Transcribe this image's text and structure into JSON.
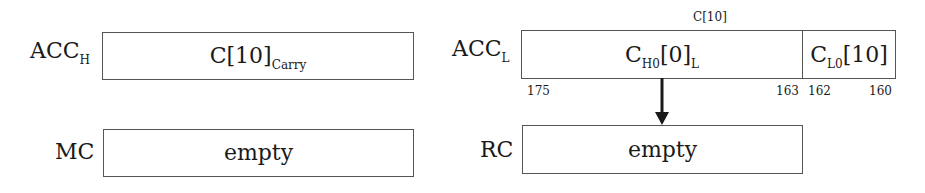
{
  "diagram": {
    "acc_h": {
      "label_main": "ACC",
      "label_sub": "H",
      "content_main": "C[10]",
      "content_sub": "Carry"
    },
    "acc_l": {
      "label_main": "ACC",
      "label_sub": "L",
      "top_label": "C[10]",
      "cells": [
        {
          "content_prefix": "C",
          "content_sub1": "H0",
          "content_mid": "[0]",
          "content_sub2": "L",
          "bit_high": "175",
          "bit_low": "163"
        },
        {
          "content_prefix": "C",
          "content_sub1": "L0",
          "content_mid": "[10]",
          "bit_high": "162",
          "bit_low": "160"
        }
      ]
    },
    "mc": {
      "label": "MC",
      "content": "empty"
    },
    "rc": {
      "label": "RC",
      "content": "empty"
    },
    "arrow": {
      "from": "acc_l.cells.0",
      "to": "rc",
      "icon": "down-arrow-icon"
    }
  }
}
